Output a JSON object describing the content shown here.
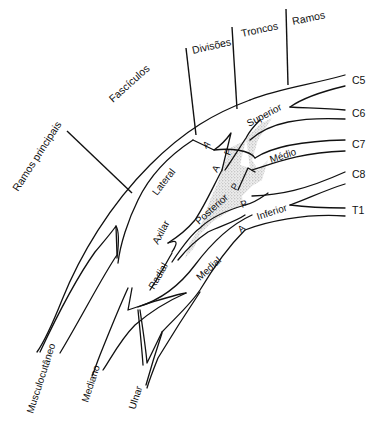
{
  "colors": {
    "line": "#111111",
    "background": "#ffffff",
    "posterior_shading": "#cfcfcf"
  },
  "section_headers": {
    "ramos_principais": "Ramos principais",
    "fasciculos": "Fascículos",
    "divisoes": "Divisões",
    "troncos": "Troncos",
    "ramos": "Ramos"
  },
  "roots": [
    "C5",
    "C6",
    "C7",
    "C8",
    "T1"
  ],
  "trunks": {
    "superior": "Superior",
    "medio": "Médio",
    "inferior": "Inferior"
  },
  "divisions": {
    "anterior": "A",
    "posterior": "P"
  },
  "cords": {
    "lateral": "Lateral",
    "posterior": "Posterior",
    "medial": "Medial"
  },
  "terminal_branches": {
    "axilar": "Axilar",
    "radial": "Radial",
    "musculocutaneo": "Musculocutâneo",
    "mediano": "Mediano",
    "ulnar": "Ulnar"
  }
}
